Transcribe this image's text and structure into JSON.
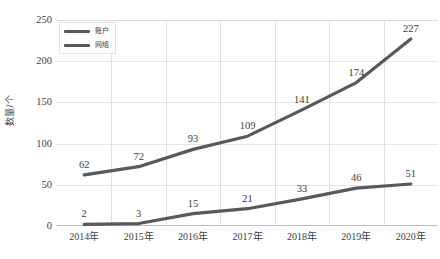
{
  "chart_data": {
    "type": "line",
    "title": "",
    "subtitle": "",
    "xlabel": "",
    "ylabel": "数量/个",
    "categories": [
      "2014年",
      "2015年",
      "2016年",
      "2017年",
      "2018年",
      "2019年",
      "2020年"
    ],
    "series": [
      {
        "name": "账户",
        "values": [
          62,
          72,
          93,
          109,
          141,
          174,
          227
        ],
        "color": "#595959"
      },
      {
        "name": "网络",
        "values": [
          2,
          3,
          15,
          21,
          33,
          46,
          51
        ],
        "color": "#595959"
      }
    ],
    "ylim": [
      0,
      250
    ],
    "yticks": [
      0,
      50,
      100,
      150,
      200,
      250
    ],
    "ytick_labels": [
      "0",
      "50",
      "100",
      "150",
      "200",
      "250"
    ],
    "grid": true,
    "grid_axis": "both",
    "legend_position": "top-left",
    "data_labels": true
  },
  "caption": {
    "text": ""
  },
  "colors": {
    "line": "#595959",
    "grid": "#e3e3e3",
    "text": "#404040",
    "background": "#ffffff"
  }
}
